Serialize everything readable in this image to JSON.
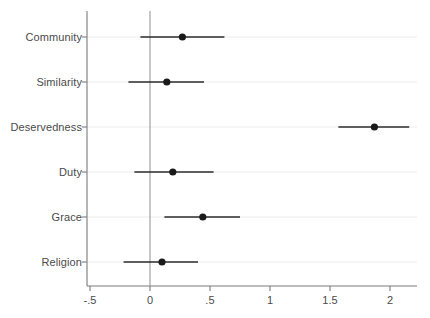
{
  "chart_data": {
    "type": "scatter",
    "plot_style": "dot-and-whisker coefficient plot",
    "title": "",
    "subtitle": "",
    "xlabel": "",
    "ylabel": "",
    "categories": [
      "Community",
      "Similarity",
      "Deservedness",
      "Duty",
      "Grace",
      "Religion"
    ],
    "series": [
      {
        "name": "Coefficient estimate",
        "values": [
          0.27,
          0.14,
          1.87,
          0.19,
          0.44,
          0.1
        ]
      },
      {
        "name": "CI lower",
        "values": [
          -0.08,
          -0.18,
          1.57,
          -0.13,
          0.12,
          -0.22
        ]
      },
      {
        "name": "CI upper",
        "values": [
          0.62,
          0.45,
          2.16,
          0.53,
          0.75,
          0.4
        ]
      }
    ],
    "points": [
      {
        "label": "Community",
        "estimate": 0.27,
        "ci_low": -0.08,
        "ci_high": 0.62
      },
      {
        "label": "Similarity",
        "estimate": 0.14,
        "ci_low": -0.18,
        "ci_high": 0.45
      },
      {
        "label": "Deservedness",
        "estimate": 1.87,
        "ci_low": 1.57,
        "ci_high": 2.16
      },
      {
        "label": "Duty",
        "estimate": 0.19,
        "ci_low": -0.13,
        "ci_high": 0.53
      },
      {
        "label": "Grace",
        "estimate": 0.44,
        "ci_low": 0.12,
        "ci_high": 0.75
      },
      {
        "label": "Religion",
        "estimate": 0.1,
        "ci_low": -0.22,
        "ci_high": 0.4
      }
    ],
    "xticks": [
      -0.5,
      0,
      0.5,
      1,
      1.5,
      2
    ],
    "xtick_labels": [
      "-.5",
      "0",
      ".5",
      "1",
      "1.5",
      "2"
    ],
    "xlim": [
      -0.6,
      2.23
    ],
    "grid": true,
    "grid_orientation": "horizontal",
    "reference_line": 0,
    "legend": null,
    "legend_position": "none",
    "colors": {
      "marker": "#1a1a1a",
      "whisker": "#2b2b2b",
      "axis": "#7a7a7a",
      "gridline": "#ececec",
      "reference_line": "#9a9a9a",
      "text": "#4a4a4a",
      "background": "#ffffff"
    }
  }
}
